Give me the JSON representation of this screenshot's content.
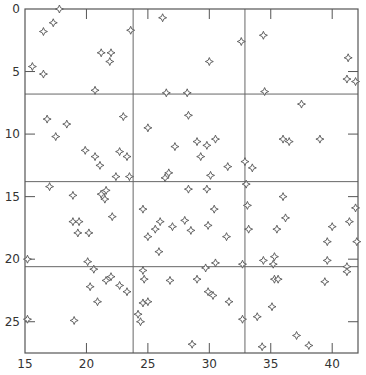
{
  "chart_data": {
    "type": "scatter",
    "title": "",
    "xlabel": "",
    "ylabel": "",
    "xlim": [
      15,
      42.1
    ],
    "ylim": [
      0,
      27.5
    ],
    "y_inverted": true,
    "grid": false,
    "marker": "four-point-star",
    "x_ticks": [
      15,
      20,
      25,
      30,
      35,
      40
    ],
    "x_tick_labels": [
      "15",
      "20",
      "25",
      "30",
      "35",
      "40"
    ],
    "y_ticks": [
      0,
      5,
      10,
      15,
      20,
      25
    ],
    "y_tick_labels": [
      "0",
      "5",
      "10",
      "15",
      "20",
      "25"
    ],
    "reference_lines": {
      "vertical_x": [
        23.8,
        32.9
      ],
      "horizontal_y": [
        6.8,
        13.8,
        20.6
      ]
    },
    "points": [
      [
        17.8,
        0.0
      ],
      [
        17.3,
        1.1
      ],
      [
        16.5,
        1.8
      ],
      [
        23.6,
        1.7
      ],
      [
        21.2,
        3.5
      ],
      [
        22.0,
        3.5
      ],
      [
        21.9,
        4.2
      ],
      [
        15.6,
        4.6
      ],
      [
        16.5,
        5.2
      ],
      [
        20.7,
        6.5
      ],
      [
        26.2,
        0.7
      ],
      [
        30.0,
        4.2
      ],
      [
        32.6,
        2.6
      ],
      [
        34.4,
        2.1
      ],
      [
        26.5,
        6.7
      ],
      [
        28.2,
        6.7
      ],
      [
        34.5,
        6.6
      ],
      [
        41.3,
        3.9
      ],
      [
        41.2,
        5.6
      ],
      [
        41.9,
        5.8
      ],
      [
        16.8,
        8.8
      ],
      [
        18.4,
        9.2
      ],
      [
        17.5,
        10.2
      ],
      [
        23.0,
        8.6
      ],
      [
        19.9,
        11.3
      ],
      [
        20.7,
        11.8
      ],
      [
        21.1,
        12.5
      ],
      [
        22.7,
        11.4
      ],
      [
        23.3,
        11.8
      ],
      [
        22.4,
        13.4
      ],
      [
        23.5,
        13.4
      ],
      [
        25.0,
        9.5
      ],
      [
        28.3,
        8.5
      ],
      [
        27.2,
        11.0
      ],
      [
        29.0,
        10.6
      ],
      [
        29.8,
        10.9
      ],
      [
        30.5,
        10.4
      ],
      [
        29.3,
        11.8
      ],
      [
        31.5,
        12.6
      ],
      [
        26.7,
        13.1
      ],
      [
        26.4,
        13.5
      ],
      [
        30.1,
        13.3
      ],
      [
        32.9,
        12.2
      ],
      [
        33.0,
        14.0
      ],
      [
        29.8,
        14.4
      ],
      [
        37.5,
        7.6
      ],
      [
        36.0,
        10.4
      ],
      [
        36.5,
        10.6
      ],
      [
        39.0,
        10.4
      ],
      [
        33.5,
        12.7
      ],
      [
        17.0,
        14.2
      ],
      [
        18.9,
        14.9
      ],
      [
        21.2,
        14.8
      ],
      [
        21.6,
        14.5
      ],
      [
        21.5,
        15.2
      ],
      [
        22.1,
        16.6
      ],
      [
        18.9,
        17.0
      ],
      [
        19.4,
        17.0
      ],
      [
        19.3,
        17.9
      ],
      [
        20.2,
        17.9
      ],
      [
        15.2,
        20.0
      ],
      [
        20.1,
        20.2
      ],
      [
        20.6,
        20.8
      ],
      [
        21.6,
        21.7
      ],
      [
        22.0,
        21.4
      ],
      [
        20.3,
        22.2
      ],
      [
        22.7,
        22.1
      ],
      [
        23.3,
        22.6
      ],
      [
        20.9,
        23.4
      ],
      [
        15.2,
        24.8
      ],
      [
        19.0,
        24.9
      ],
      [
        24.6,
        16.0
      ],
      [
        28.3,
        14.4
      ],
      [
        30.4,
        16.0
      ],
      [
        26.0,
        17.0
      ],
      [
        28.0,
        16.9
      ],
      [
        25.6,
        17.6
      ],
      [
        27.0,
        17.4
      ],
      [
        28.5,
        17.7
      ],
      [
        29.9,
        17.3
      ],
      [
        25.0,
        18.2
      ],
      [
        31.4,
        18.2
      ],
      [
        25.9,
        19.4
      ],
      [
        30.5,
        20.3
      ],
      [
        32.7,
        20.4
      ],
      [
        24.6,
        20.9
      ],
      [
        24.7,
        21.6
      ],
      [
        26.8,
        21.7
      ],
      [
        29.0,
        21.6
      ],
      [
        29.7,
        20.7
      ],
      [
        29.9,
        22.6
      ],
      [
        30.3,
        22.9
      ],
      [
        31.6,
        23.4
      ],
      [
        24.6,
        23.5
      ],
      [
        25.0,
        23.4
      ],
      [
        24.2,
        24.4
      ],
      [
        24.4,
        25.0
      ],
      [
        32.7,
        24.8
      ],
      [
        28.6,
        26.8
      ],
      [
        36.0,
        15.0
      ],
      [
        33.1,
        15.7
      ],
      [
        36.2,
        16.7
      ],
      [
        33.2,
        17.6
      ],
      [
        35.5,
        17.6
      ],
      [
        40.0,
        17.4
      ],
      [
        41.4,
        17.0
      ],
      [
        39.6,
        18.6
      ],
      [
        42.0,
        18.6
      ],
      [
        41.9,
        15.9
      ],
      [
        34.4,
        20.1
      ],
      [
        35.3,
        19.8
      ],
      [
        35.2,
        20.4
      ],
      [
        39.6,
        20.1
      ],
      [
        41.2,
        20.6
      ],
      [
        41.2,
        21.0
      ],
      [
        35.3,
        21.6
      ],
      [
        35.6,
        21.6
      ],
      [
        39.4,
        21.8
      ],
      [
        35.1,
        23.8
      ],
      [
        33.9,
        24.6
      ],
      [
        37.1,
        26.1
      ],
      [
        38.1,
        26.9
      ],
      [
        34.3,
        27.0
      ]
    ]
  }
}
